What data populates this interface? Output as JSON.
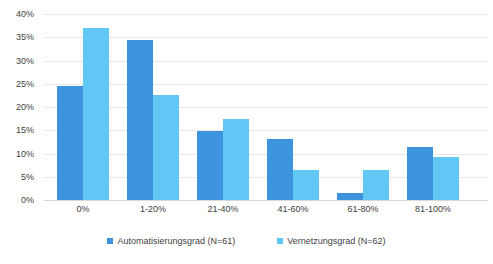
{
  "chart_data": {
    "type": "bar",
    "title": "",
    "xlabel": "",
    "ylabel": "",
    "categories": [
      "0%",
      "1-20%",
      "21-40%",
      "41-60%",
      "61-80%",
      "81-100%"
    ],
    "series": [
      {
        "name": "Automatisierungsgrad (N=61)",
        "color": "#3d93dd",
        "values": [
          24.6,
          34.4,
          14.8,
          13.1,
          1.6,
          11.5
        ]
      },
      {
        "name": "Vernetzungsgrad (N=62)",
        "color": "#61c8f5",
        "values": [
          37.1,
          22.6,
          17.4,
          6.5,
          6.5,
          9.3
        ]
      }
    ],
    "ylim": [
      0,
      40
    ],
    "ytick_values": [
      0,
      5,
      10,
      15,
      20,
      25,
      30,
      35,
      40
    ],
    "ytick_labels": [
      "0%",
      "5%",
      "10%",
      "15%",
      "20%",
      "25%",
      "30%",
      "35%",
      "40%"
    ],
    "grid": true,
    "legend_position": "bottom"
  }
}
